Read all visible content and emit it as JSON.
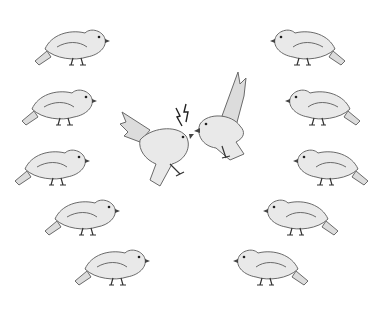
{
  "scene": {
    "description": "Illustration of two birds fighting in mid-air, surrounded by rows of perched birds watching",
    "background": "#ffffff",
    "bird_fill": "#e9e9e9",
    "outline_color": "#6a6a6a",
    "left_column_birds": [
      {
        "x": 75,
        "y": 45,
        "facing": "right"
      },
      {
        "x": 62,
        "y": 105,
        "facing": "right"
      },
      {
        "x": 55,
        "y": 165,
        "facing": "right"
      },
      {
        "x": 85,
        "y": 215,
        "facing": "right"
      },
      {
        "x": 115,
        "y": 265,
        "facing": "right"
      }
    ],
    "right_column_birds": [
      {
        "x": 305,
        "y": 45,
        "facing": "left"
      },
      {
        "x": 320,
        "y": 105,
        "facing": "left"
      },
      {
        "x": 328,
        "y": 165,
        "facing": "left"
      },
      {
        "x": 298,
        "y": 215,
        "facing": "left"
      },
      {
        "x": 268,
        "y": 265,
        "facing": "left"
      }
    ],
    "fighting_birds": [
      {
        "x": 160,
        "y": 145,
        "facing": "right"
      },
      {
        "x": 220,
        "y": 125,
        "facing": "left"
      }
    ],
    "symbols": [
      "lightning-bolt",
      "lightning-bolt"
    ]
  }
}
